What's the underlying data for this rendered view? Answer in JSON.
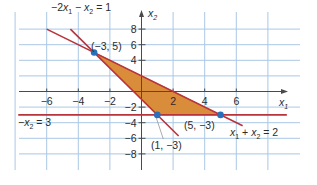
{
  "figure": {
    "colors": {
      "grid": "#a9c8e6",
      "axis": "#4a4a4a",
      "boundary": "#b8333a",
      "region_fill": "#d98c3a",
      "region_stroke": "#9a4a1e",
      "vertex": "#2a6fba",
      "text": "#2b2b2b",
      "leader": "#8a8a8a"
    },
    "axes": {
      "x_label": "x",
      "x_label_sub": "1",
      "y_label": "x",
      "y_label_sub": "2",
      "x_ticks": [
        {
          "value": -6,
          "label": "−6"
        },
        {
          "value": -4,
          "label": "−4"
        },
        {
          "value": -2,
          "label": "−2"
        },
        {
          "value": 2,
          "label": "2"
        },
        {
          "value": 4,
          "label": "4"
        },
        {
          "value": 6,
          "label": "6"
        }
      ],
      "y_ticks": [
        {
          "value": 8,
          "label": "8"
        },
        {
          "value": 6,
          "label": "6"
        },
        {
          "value": 4,
          "label": "4"
        },
        {
          "value": -2,
          "label": "−2"
        },
        {
          "value": -4,
          "label": "−4"
        },
        {
          "value": -6,
          "label": "−6"
        },
        {
          "value": -8,
          "label": "−8"
        }
      ],
      "grid_x": [
        -8,
        -6,
        -4,
        -2,
        0,
        2,
        4,
        6,
        8
      ],
      "grid_y": [
        8,
        6,
        4,
        2,
        0,
        -2,
        -4,
        -6,
        -8
      ]
    },
    "lines": [
      {
        "name": "-2x1-x2=1",
        "label_parts": [
          "−2",
          "x",
          "1",
          " − ",
          "x",
          "2",
          " = 1"
        ],
        "from": [
          -4.5,
          8
        ],
        "to": [
          2.35,
          -5.7
        ]
      },
      {
        "name": "x1+x2=2",
        "label_parts": [
          "x",
          "1",
          " + ",
          "x",
          "2",
          " = 2"
        ],
        "from": [
          -6,
          8
        ],
        "to": [
          6.4,
          -4.4
        ]
      },
      {
        "name": "-x2=3",
        "label_parts": [
          "−",
          "x",
          "2",
          " = 3"
        ],
        "from": [
          -7.8,
          -3
        ],
        "to": [
          9.2,
          -3
        ]
      }
    ],
    "region": {
      "vertices": [
        [
          -3,
          5
        ],
        [
          5,
          -3
        ],
        [
          1,
          -3
        ]
      ]
    },
    "vertices": [
      {
        "point": [
          -3,
          5
        ],
        "label": "(−3, 5)"
      },
      {
        "point": [
          1,
          -3
        ],
        "label": "(1, −3)"
      },
      {
        "point": [
          5,
          -3
        ],
        "label": "(5, −3)"
      }
    ]
  }
}
